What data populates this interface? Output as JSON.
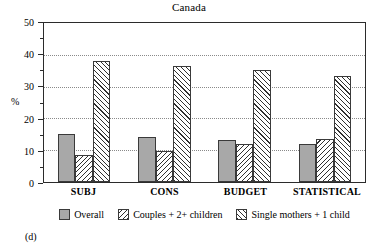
{
  "chart_data": {
    "type": "bar",
    "title": "Canada",
    "xlabel": "",
    "ylabel": "%",
    "ylim": [
      0,
      50
    ],
    "yticks": [
      0,
      10,
      20,
      30,
      40,
      50
    ],
    "yminor_ticks": [
      5,
      15,
      25,
      35,
      45
    ],
    "grid": "horizontal-dotted",
    "legend_position": "bottom-center",
    "categories": [
      "SUBJ",
      "CONS",
      "BUDGET",
      "STATISTICAL"
    ],
    "series": [
      {
        "name": "Overall",
        "values": [
          15.1,
          14.3,
          13.2,
          12.1
        ],
        "fill": "solid-gray"
      },
      {
        "name": "Couples + 2+ children",
        "values": [
          8.6,
          9.9,
          12.0,
          13.6
        ],
        "fill": "hatch-backslash"
      },
      {
        "name": "Single mothers + 1 child",
        "values": [
          38.2,
          36.5,
          35.1,
          33.4
        ],
        "fill": "hatch-forwardslash"
      }
    ],
    "panel_label": "(d)",
    "colors": {
      "series1_fill": "#a8a8a8",
      "hatch_stroke": "#303030",
      "axis": "#2b2b2b",
      "gridline": "#8a8a8a",
      "background": "#ffffff"
    }
  },
  "axis": {
    "y_tick_labels": [
      "0",
      "10",
      "20",
      "30",
      "40",
      "50"
    ],
    "unit_label": "%"
  },
  "legend": {
    "items": [
      {
        "label": "Overall"
      },
      {
        "label": "Couples + 2+ children"
      },
      {
        "label": "Single mothers + 1 child"
      }
    ]
  }
}
